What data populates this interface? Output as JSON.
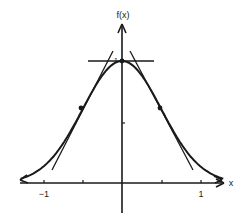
{
  "chart_data": {
    "type": "line",
    "title": "",
    "xlabel": "x",
    "ylabel": "f(x)",
    "xlim": [
      -1.3,
      1.3
    ],
    "ylim": [
      -0.3,
      1.3
    ],
    "x_ticks": [
      -1,
      -0.5,
      0.5,
      1
    ],
    "x_tick_labels": [
      "-1",
      "",
      "",
      "1"
    ],
    "y_ticks": [
      0.5,
      1
    ],
    "y_tick_labels": [
      "",
      "1"
    ],
    "grid": false,
    "legend": [],
    "series": [
      {
        "name": "f(x)",
        "function": "exp(-2x^2)",
        "x": [
          -1.3,
          -1.0,
          -0.75,
          -0.5,
          -0.25,
          0,
          0.25,
          0.5,
          0.75,
          1.0,
          1.3
        ],
        "values": [
          0.034,
          0.135,
          0.325,
          0.607,
          0.882,
          1.0,
          0.882,
          0.607,
          0.325,
          0.135,
          0.034
        ]
      }
    ],
    "annotations": {
      "points": [
        {
          "x": -0.5,
          "y": 0.607,
          "label": "inflection point"
        },
        {
          "x": 0,
          "y": 1.0,
          "label": "maximum"
        },
        {
          "x": 0.5,
          "y": 0.607,
          "label": "inflection point"
        }
      ],
      "tangent_lines": [
        {
          "at_x": 0,
          "slope": 0,
          "label": "horizontal tangent at maximum"
        },
        {
          "at_x": -0.5,
          "slope": 1.213,
          "label": "tangent at left inflection"
        },
        {
          "at_x": 0.5,
          "slope": -1.213,
          "label": "tangent at right inflection"
        }
      ]
    }
  },
  "labels": {
    "x_axis": "x",
    "y_axis": "f(x)",
    "tick_neg1": "−1",
    "tick_pos1": "1",
    "tick_y1": "1"
  },
  "colors": {
    "ink": "#1a1a1a",
    "background": "#ffffff"
  }
}
